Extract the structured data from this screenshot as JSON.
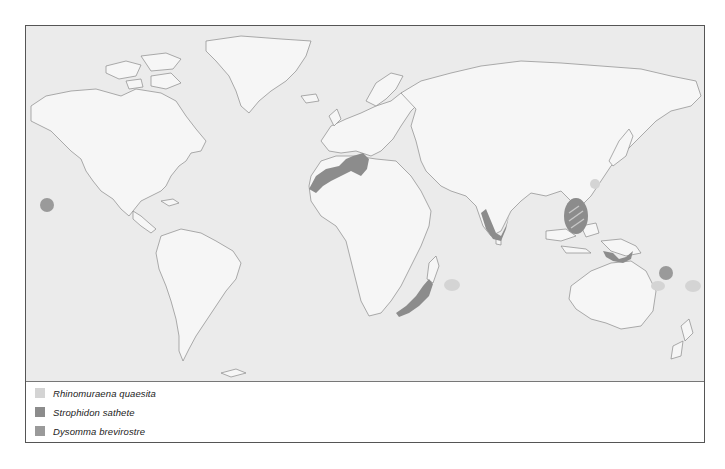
{
  "map": {
    "title": "Species distribution map",
    "colors": {
      "ocean": "#ebebeb",
      "land": "#f6f6f6",
      "coastline": "#8a8a8a",
      "frame": "#555555"
    }
  },
  "legend": {
    "items": [
      {
        "label": "Rhinomuraena quaesita",
        "color": "#d4d4d4"
      },
      {
        "label": "Strophidon sathete",
        "color": "#8c8c8c"
      },
      {
        "label": "Dysomma brevirostre",
        "color": "#9a9a9a"
      }
    ]
  },
  "regions": [
    {
      "species": "Strophidon sathete",
      "area": "Mediterranean & NW Africa coast"
    },
    {
      "species": "Strophidon sathete",
      "area": "India west coast"
    },
    {
      "species": "Strophidon sathete",
      "area": "SE Africa / Mozambique coast"
    },
    {
      "species": "Strophidon sathete",
      "area": "South China Sea / Philippines"
    },
    {
      "species": "Strophidon sathete",
      "area": "New Guinea"
    },
    {
      "species": "Dysomma brevirostre",
      "area": "Hawaii"
    },
    {
      "species": "Dysomma brevirostre",
      "area": "Solomon Islands"
    },
    {
      "species": "Rhinomuraena quaesita",
      "area": "Mascarene Islands"
    },
    {
      "species": "Rhinomuraena quaesita",
      "area": "New Caledonia / Fiji"
    },
    {
      "species": "Rhinomuraena quaesita",
      "area": "Taiwan / Ryukyu"
    }
  ]
}
